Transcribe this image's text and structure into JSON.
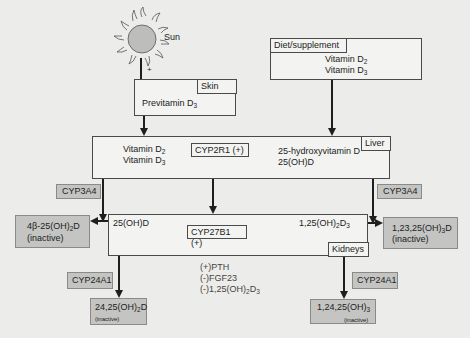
{
  "diagram": {
    "sun": {
      "label": "Sun",
      "arrow_sign": "+"
    },
    "skin": {
      "tab": "Skin",
      "content": "Previtamin D",
      "content_sub": "3"
    },
    "diet": {
      "tab": "Diet/supplement",
      "lines": [
        {
          "text": "Vitamin D",
          "sub": "2"
        },
        {
          "text": "Vitamin D",
          "sub": "3"
        }
      ]
    },
    "liver": {
      "tab": "Liver",
      "inputs": [
        {
          "text": "Vitamin D",
          "sub": "2"
        },
        {
          "text": "Vitamin D",
          "sub": "3"
        }
      ],
      "enzyme": "CYP2R1 (+)",
      "product_line1": "25-hydroxyvitamin D",
      "product_line2": "25(OH)D"
    },
    "kidneys": {
      "tab": "Kidneys",
      "input": "25(OH)D",
      "enzyme": "CYP27B1 (+)",
      "product": "1,25(OH)",
      "product_sub1": "2",
      "product_mid": "D",
      "product_sub2": "3",
      "regulators": [
        "(+)PTH",
        "(-)FGF23",
        "(-)1,25(OH)"
      ],
      "regulator3_sub1": "2",
      "regulator3_mid": "D",
      "regulator3_sub2": "3"
    },
    "left_branch": {
      "enzyme": "CYP3A4",
      "product": "4β-25(OH)",
      "product_sub": "2",
      "product_tail": "D",
      "status": "(inactive)"
    },
    "right_branch": {
      "enzyme": "CYP3A4",
      "product": "1,23,25(OH)",
      "product_sub": "3",
      "product_tail": "D",
      "status": "(inactive)"
    },
    "bottom_left": {
      "enzyme": "CYP24A1",
      "product": "24,25(OH)",
      "product_sub": "2",
      "product_tail": "D",
      "status": "(inactive)"
    },
    "bottom_right": {
      "enzyme": "CYP24A1",
      "product": "1,24,25(OH)",
      "product_sub": "3",
      "product_tail": "",
      "status": "(inactive)"
    },
    "colors": {
      "background": "#ececea",
      "box_fill": "#f3f3f1",
      "inactive_fill": "#c4c4c2",
      "line": "#1e1e1e"
    }
  }
}
